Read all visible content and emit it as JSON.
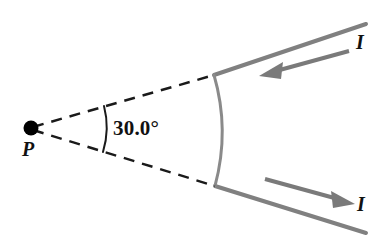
{
  "figure": {
    "background_color": "#ffffff",
    "width": 391,
    "height": 249,
    "labels": {
      "point_P": "P",
      "angle": "30.0°",
      "current_top": "I",
      "current_bottom": "I"
    },
    "colors": {
      "wire": "#808080",
      "arrow": "#7a7a7a",
      "dashed": "#1a1a1a",
      "text": "#111111",
      "point": "#000000"
    },
    "geometry": {
      "point_P": {
        "x": 31,
        "y": 128,
        "radius": 7
      },
      "dashed_upper": {
        "x1": 31,
        "y1": 128,
        "x2": 214,
        "y2": 75
      },
      "dashed_lower": {
        "x1": 31,
        "y1": 128,
        "x2": 215,
        "y2": 186
      },
      "arc_segment": {
        "x1": 214,
        "y1": 75,
        "x2": 215,
        "y2": 186,
        "bulge_x": 228,
        "bulge_y": 130
      },
      "wire_upper": {
        "x1": 214,
        "y1": 75,
        "x2": 366,
        "y2": 24
      },
      "wire_lower": {
        "x1": 215,
        "y1": 186,
        "x2": 366,
        "y2": 233
      },
      "arrow_upper": {
        "tail_x": 349,
        "tail_y": 51,
        "head_x": 262,
        "head_y": 75,
        "direction": "left"
      },
      "arrow_lower": {
        "tail_x": 265,
        "tail_y": 179,
        "head_x": 352,
        "head_y": 203,
        "direction": "right"
      },
      "angle_arc": {
        "cx": 31,
        "cy": 128,
        "radius": 76,
        "start_deg": -16.2,
        "end_deg": 17.5
      }
    },
    "physics": {
      "subtended_angle_degrees": 30.0,
      "current_symbol": "I",
      "field_point": "P"
    }
  }
}
